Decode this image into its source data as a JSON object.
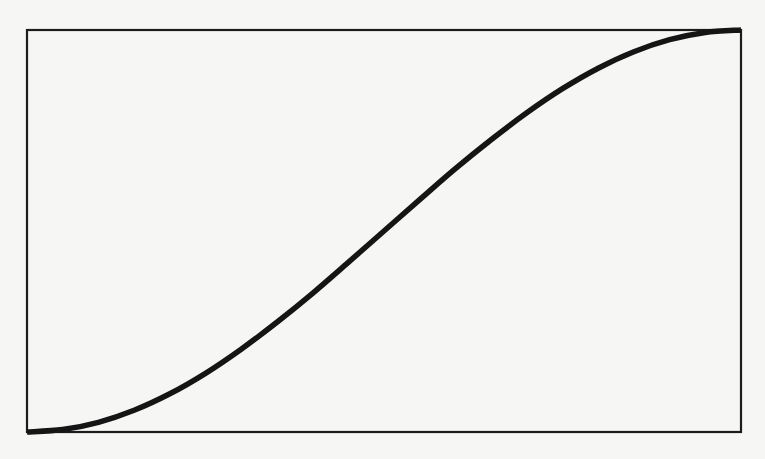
{
  "colors": {
    "background": "#f6f6f4",
    "frame": "#1c1c1c",
    "curve": "#151515"
  },
  "plot_box": {
    "left": 27,
    "top": 30,
    "right": 741,
    "bottom": 432
  },
  "chart_data": {
    "type": "line",
    "title": "",
    "xlabel": "",
    "ylabel": "",
    "xlim": [
      0,
      1
    ],
    "ylim": [
      0,
      1
    ],
    "grid": false,
    "legend": null,
    "tick_labels": {
      "x": [],
      "y": []
    },
    "series": [
      {
        "name": "curve",
        "x": [
          0.0,
          0.05,
          0.1,
          0.15,
          0.2,
          0.25,
          0.3,
          0.35,
          0.4,
          0.45,
          0.5,
          0.55,
          0.6,
          0.65,
          0.7,
          0.75,
          0.8,
          0.85,
          0.9,
          0.95,
          1.0
        ],
        "values": [
          0.0,
          0.006,
          0.024,
          0.054,
          0.095,
          0.146,
          0.206,
          0.273,
          0.345,
          0.422,
          0.5,
          0.578,
          0.655,
          0.727,
          0.794,
          0.854,
          0.905,
          0.946,
          0.976,
          0.994,
          1.0
        ]
      }
    ]
  }
}
